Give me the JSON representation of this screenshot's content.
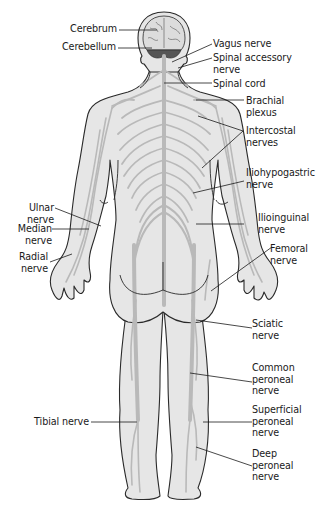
{
  "diagram": {
    "colors": {
      "skin": "#e6e6e6",
      "outline": "#2a2a2a",
      "nerve": "#b9b9b9",
      "brain": "#dcdcdc",
      "cerebellum": "#555555",
      "leader": "#1a1a1a",
      "background": "#ffffff"
    },
    "labels_left": [
      {
        "id": "cerebrum",
        "text": "Cerebrum"
      },
      {
        "id": "cerebellum",
        "text": "Cerebellum"
      },
      {
        "id": "ulnar",
        "text": "Ulnar\nnerve"
      },
      {
        "id": "median",
        "text": "Median\nnerve"
      },
      {
        "id": "radial",
        "text": "Radial\nnerve"
      },
      {
        "id": "tibial",
        "text": "Tibial nerve"
      }
    ],
    "labels_right": [
      {
        "id": "vagus",
        "text": "Vagus nerve"
      },
      {
        "id": "spinal_accessory",
        "text": "Spinal accessory\nnerve"
      },
      {
        "id": "spinal_cord",
        "text": "Spinal cord"
      },
      {
        "id": "brachial",
        "text": "Brachial\nplexus"
      },
      {
        "id": "intercostal",
        "text": "Intercostal\nnerves"
      },
      {
        "id": "iliohypogastric",
        "text": "Iliohypogastric\nnerve"
      },
      {
        "id": "ilioinguinal",
        "text": "Ilioinguinal\nnerve"
      },
      {
        "id": "femoral",
        "text": "Femoral\nnerve"
      },
      {
        "id": "sciatic",
        "text": "Sciatic\nnerve"
      },
      {
        "id": "common_peroneal",
        "text": "Common\nperoneal\nnerve"
      },
      {
        "id": "superficial_peroneal",
        "text": "Superficial\nperoneal\nnerve"
      },
      {
        "id": "deep_peroneal",
        "text": "Deep\nperoneal\nnerve"
      }
    ]
  }
}
